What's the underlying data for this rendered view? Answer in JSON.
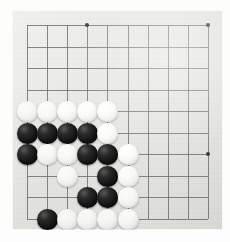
{
  "scene": {
    "kind": "go-board-photo",
    "description": "Go (Weiqi/Baduk) board corner position with black and white stones"
  },
  "board": {
    "name": "go-board",
    "background_color": "#e9e9e5",
    "line_color": "#6e6e70",
    "columns": 10,
    "rows": 10,
    "origin_x": 27,
    "origin_y": 25,
    "cell_width": 20.1,
    "cell_height": 21.5,
    "stone_diameter": 21,
    "star_points": [
      {
        "col": 3,
        "row": 0
      },
      {
        "col": 9,
        "row": 0
      },
      {
        "col": 9,
        "row": 6
      }
    ]
  },
  "stones": [
    {
      "col": 0,
      "row": 4,
      "color": "white"
    },
    {
      "col": 1,
      "row": 4,
      "color": "white"
    },
    {
      "col": 2,
      "row": 4,
      "color": "white"
    },
    {
      "col": 3,
      "row": 4,
      "color": "white"
    },
    {
      "col": 4,
      "row": 4,
      "color": "white"
    },
    {
      "col": 0,
      "row": 5,
      "color": "black"
    },
    {
      "col": 1,
      "row": 5,
      "color": "black"
    },
    {
      "col": 2,
      "row": 5,
      "color": "black"
    },
    {
      "col": 3,
      "row": 5,
      "color": "black"
    },
    {
      "col": 4,
      "row": 5,
      "color": "white"
    },
    {
      "col": 0,
      "row": 6,
      "color": "black"
    },
    {
      "col": 1,
      "row": 6,
      "color": "white"
    },
    {
      "col": 2,
      "row": 6,
      "color": "white"
    },
    {
      "col": 3,
      "row": 6,
      "color": "black"
    },
    {
      "col": 4,
      "row": 6,
      "color": "black"
    },
    {
      "col": 5,
      "row": 6,
      "color": "white"
    },
    {
      "col": 2,
      "row": 7,
      "color": "white"
    },
    {
      "col": 4,
      "row": 7,
      "color": "black"
    },
    {
      "col": 5,
      "row": 7,
      "color": "white"
    },
    {
      "col": 3,
      "row": 8,
      "color": "black"
    },
    {
      "col": 4,
      "row": 8,
      "color": "black"
    },
    {
      "col": 5,
      "row": 8,
      "color": "white"
    },
    {
      "col": 1,
      "row": 9,
      "color": "black"
    },
    {
      "col": 2,
      "row": 9,
      "color": "white"
    },
    {
      "col": 3,
      "row": 9,
      "color": "white"
    },
    {
      "col": 4,
      "row": 9,
      "color": "white"
    },
    {
      "col": 5,
      "row": 9,
      "color": "white"
    }
  ],
  "counts": {
    "black_stones": 12,
    "white_stones": 15,
    "total_stones": 27
  }
}
